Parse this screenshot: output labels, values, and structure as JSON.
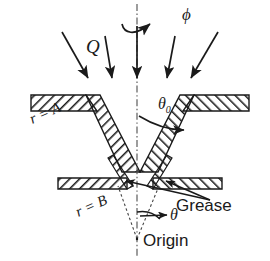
{
  "figure": {
    "type": "technical-cross-section-diagram",
    "background_color": "#ffffff",
    "line_color": "#1a1a1a",
    "hatch_color": "#1a1a1a"
  },
  "labels": {
    "phi": "ϕ",
    "flow_rate": "Q",
    "theta_zero_base": "θ",
    "theta_zero_sub": "0",
    "theta": "θ",
    "r_equals_a": "r = A",
    "r_equals_b": "r = B",
    "grease": "Grease",
    "origin": "Origin"
  },
  "geometry": {
    "axis_x": 137,
    "origin_point": {
      "x": 137,
      "y": 238
    },
    "left_wall_inner_top": {
      "x": 84,
      "y": 103
    },
    "left_wall_inner_bottom": {
      "x": 122,
      "y": 185
    },
    "right_wall_inner_top": {
      "x": 196,
      "y": 103
    },
    "right_wall_inner_bottom": {
      "x": 158,
      "y": 185
    },
    "wall_half_angle_deg": 17,
    "r_A_radius": 148,
    "r_B_radius": 57
  },
  "arrows": {
    "count": 5,
    "label": "Q",
    "items": [
      {
        "x1": 62,
        "y1": 32,
        "x2": 90,
        "y2": 80,
        "tilt": "right-down"
      },
      {
        "x1": 104,
        "y1": 36,
        "x2": 113,
        "y2": 80,
        "tilt": "slight-right-down"
      },
      {
        "x1": 137,
        "y1": 25,
        "x2": 137,
        "y2": 80,
        "tilt": "vertical"
      },
      {
        "x1": 175,
        "y1": 36,
        "x2": 166,
        "y2": 80,
        "tilt": "slight-left-down"
      },
      {
        "x1": 218,
        "y1": 32,
        "x2": 190,
        "y2": 80,
        "tilt": "left-down"
      }
    ]
  },
  "annotations": {
    "phi_rotation": {
      "type": "curved-arrow",
      "points_to": "right",
      "near_axis_top": true
    },
    "theta_zero_leader": {
      "from": {
        "x": 158,
        "y": 114
      },
      "to": {
        "x": 187,
        "y": 128
      }
    },
    "grease_leaders": [
      {
        "from": {
          "x": 214,
          "y": 202
        },
        "to": {
          "x": 125,
          "y": 183
        }
      },
      {
        "from": {
          "x": 214,
          "y": 202
        },
        "to": {
          "x": 163,
          "y": 182
        }
      }
    ],
    "theta_arc_arrow": {
      "from": {
        "x": 137,
        "y": 218
      },
      "to": {
        "x": 168,
        "y": 210
      }
    },
    "dashed_rays": [
      {
        "from": {
          "x": 137,
          "y": 238
        },
        "to": {
          "x": 120,
          "y": 185
        }
      },
      {
        "from": {
          "x": 137,
          "y": 238
        },
        "to": {
          "x": 158,
          "y": 186
        }
      }
    ]
  }
}
